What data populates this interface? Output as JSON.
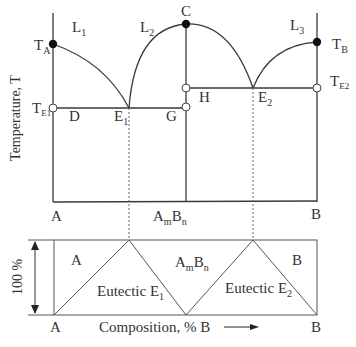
{
  "figure": {
    "type": "binary phase diagram with congruent compound and two eutectics",
    "y_axis_label": "Temperature, T",
    "points": {
      "TA": {
        "main": "T",
        "sub": "A",
        "marker": "filled"
      },
      "TB": {
        "main": "T",
        "sub": "B",
        "marker": "filled"
      },
      "TE1": {
        "main": "T",
        "sub": "E1",
        "marker": "open"
      },
      "TE2": {
        "main": "T",
        "sub": "E2",
        "marker": "open"
      },
      "C": {
        "label": "C",
        "marker": "filled"
      },
      "D": {
        "label": "D"
      },
      "E1": {
        "main": "E",
        "sub": "1"
      },
      "G": {
        "label": "G",
        "marker": "open"
      },
      "H": {
        "label": "H",
        "marker": "open"
      },
      "E2": {
        "main": "E",
        "sub": "2"
      }
    },
    "regions": {
      "L1": {
        "main": "L",
        "sub": "1"
      },
      "L2": {
        "main": "L",
        "sub": "2"
      },
      "L3": {
        "main": "L",
        "sub": "3"
      }
    },
    "x_labels": {
      "A": "A",
      "compound": {
        "a": "A",
        "m": "m",
        "b": "B",
        "n": "n"
      },
      "B": "B"
    },
    "lower_panel": {
      "y_label": "100 %",
      "regions": {
        "A": "A",
        "compound": {
          "a": "A",
          "m": "m",
          "b": "B",
          "n": "n"
        },
        "B": "B",
        "eutectic1": {
          "main": "Eutectic E",
          "sub": "1"
        },
        "eutectic2": {
          "main": "Eutectic E",
          "sub": "2"
        }
      },
      "x_left": "A",
      "x_right": "B",
      "x_axis_label": "Composition, % B"
    }
  }
}
